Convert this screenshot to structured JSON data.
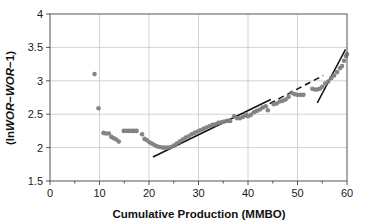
{
  "chart_data": {
    "type": "scatter",
    "title": "",
    "xlabel": "Cumulative Production (MMBO)",
    "ylabel_parts": {
      "open": "(ln",
      "wor1": "WOR",
      "minus": "−",
      "wor2": "WOR",
      "tail": "−1)"
    },
    "ylabel": "(lnWOR−WOR−1)",
    "xlim": [
      0,
      60
    ],
    "ylim": [
      1.5,
      4
    ],
    "xticks": [
      0,
      10,
      20,
      30,
      40,
      50,
      60
    ],
    "xtick_labels": [
      "0",
      "10",
      "20",
      "30",
      "40",
      "50",
      "60"
    ],
    "xminor_ticks": [
      5,
      15,
      25,
      35,
      45,
      55
    ],
    "yticks": [
      1.5,
      2,
      2.5,
      3,
      3.5,
      4
    ],
    "ytick_labels": [
      "1.5",
      "2",
      "2.5",
      "3",
      "3.5",
      "4"
    ],
    "grid": {
      "vertical": true,
      "horizontal": true
    },
    "legend": null,
    "marker": {
      "shape": "circle",
      "color": "#808080",
      "size_px": 4.6,
      "opacity": 0.95
    },
    "series": [
      {
        "name": "Field data",
        "points": [
          [
            9.0,
            3.1
          ],
          [
            9.8,
            2.59
          ],
          [
            10.8,
            2.22
          ],
          [
            11.3,
            2.21
          ],
          [
            11.9,
            2.21
          ],
          [
            12.4,
            2.16
          ],
          [
            12.9,
            2.14
          ],
          [
            13.4,
            2.12
          ],
          [
            13.9,
            2.09
          ],
          [
            14.9,
            2.25
          ],
          [
            15.4,
            2.25
          ],
          [
            15.9,
            2.25
          ],
          [
            16.5,
            2.25
          ],
          [
            17.0,
            2.25
          ],
          [
            17.5,
            2.25
          ],
          [
            18.6,
            2.2
          ],
          [
            19.1,
            2.13
          ],
          [
            19.6,
            2.11
          ],
          [
            20.1,
            2.08
          ],
          [
            20.6,
            2.06
          ],
          [
            21.1,
            2.04
          ],
          [
            21.6,
            2.02
          ],
          [
            22.1,
            2.01
          ],
          [
            22.7,
            2.0
          ],
          [
            23.2,
            2.0
          ],
          [
            23.8,
            2.0
          ],
          [
            24.4,
            2.01
          ],
          [
            25.0,
            2.03
          ],
          [
            25.6,
            2.06
          ],
          [
            26.2,
            2.09
          ],
          [
            26.8,
            2.12
          ],
          [
            27.4,
            2.15
          ],
          [
            28.0,
            2.17
          ],
          [
            28.6,
            2.2
          ],
          [
            29.2,
            2.22
          ],
          [
            29.8,
            2.24
          ],
          [
            30.4,
            2.26
          ],
          [
            31.0,
            2.28
          ],
          [
            31.6,
            2.3
          ],
          [
            32.2,
            2.32
          ],
          [
            32.8,
            2.34
          ],
          [
            33.4,
            2.35
          ],
          [
            34.0,
            2.37
          ],
          [
            34.6,
            2.38
          ],
          [
            35.2,
            2.39
          ],
          [
            35.8,
            2.4
          ],
          [
            36.4,
            2.4
          ],
          [
            37.2,
            2.47
          ],
          [
            37.8,
            2.44
          ],
          [
            38.4,
            2.44
          ],
          [
            39.0,
            2.46
          ],
          [
            39.6,
            2.5
          ],
          [
            40.0,
            2.47
          ],
          [
            40.6,
            2.49
          ],
          [
            41.2,
            2.53
          ],
          [
            41.8,
            2.55
          ],
          [
            42.4,
            2.57
          ],
          [
            43.0,
            2.6
          ],
          [
            43.6,
            2.62
          ],
          [
            44.0,
            2.56
          ],
          [
            45.2,
            2.65
          ],
          [
            45.8,
            2.66
          ],
          [
            46.4,
            2.69
          ],
          [
            47.0,
            2.7
          ],
          [
            47.6,
            2.72
          ],
          [
            48.2,
            2.76
          ],
          [
            48.8,
            2.82
          ],
          [
            49.4,
            2.8
          ],
          [
            50.0,
            2.79
          ],
          [
            50.6,
            2.79
          ],
          [
            51.2,
            2.79
          ],
          [
            53.0,
            2.88
          ],
          [
            53.5,
            2.87
          ],
          [
            54.0,
            2.87
          ],
          [
            54.5,
            2.88
          ],
          [
            55.0,
            2.91
          ],
          [
            55.6,
            2.96
          ],
          [
            56.2,
            2.99
          ],
          [
            56.8,
            3.04
          ],
          [
            57.4,
            3.08
          ],
          [
            58.0,
            3.13
          ],
          [
            58.6,
            3.19
          ],
          [
            59.0,
            3.22
          ],
          [
            59.4,
            3.3
          ],
          [
            59.8,
            3.37
          ],
          [
            60.0,
            3.4
          ]
        ]
      }
    ],
    "trend_lines": [
      {
        "name": "primary-solid-trend",
        "style": "solid",
        "x1": 20.8,
        "y1": 1.86,
        "x2": 44.6,
        "y2": 2.72
      },
      {
        "name": "extended-dashed-trend",
        "style": "dashed",
        "x1": 39.0,
        "y1": 2.45,
        "x2": 55.2,
        "y2": 3.08
      },
      {
        "name": "late-steep-solid-trend",
        "style": "solid",
        "x1": 54.0,
        "y1": 2.67,
        "x2": 59.7,
        "y2": 3.47
      }
    ]
  }
}
